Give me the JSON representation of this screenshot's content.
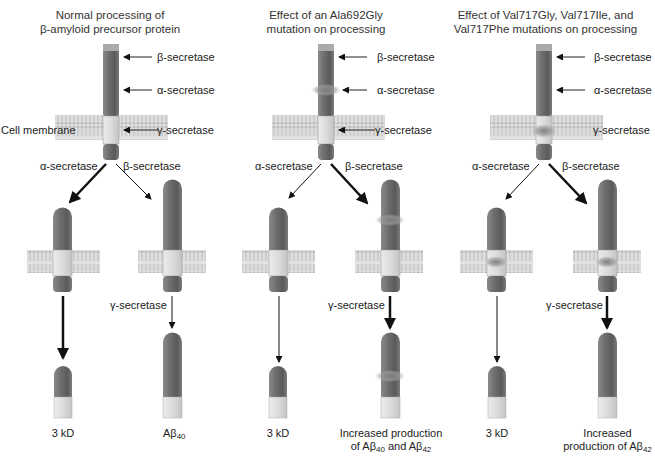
{
  "panels": [
    {
      "title_line1": "Normal processing of",
      "title_line2": "β-amyloid precursor protein",
      "cleavage_labels": {
        "beta": "β-secretase",
        "alpha": "α-secretase",
        "gamma": "γ-secretase"
      },
      "membrane_label": "Cell membrane",
      "branch_left": "α-secretase",
      "branch_right": "β-secretase",
      "gamma_step": "γ-secretase",
      "product_left": "3 kD",
      "product_right_main": "Aβ",
      "product_right_sub": "40",
      "mutation_marker": "none"
    },
    {
      "title_line1": "Effect of an Ala692Gly",
      "title_line2": "mutation on processing",
      "cleavage_labels": {
        "beta": "β-secretase",
        "alpha": "α-secretase",
        "gamma": "γ-secretase"
      },
      "branch_left": "α-secretase",
      "branch_right": "β-secretase",
      "gamma_step": "γ-secretase",
      "product_left": "3 kD",
      "product_right_line1": "Increased production",
      "product_right_line2_a": "of Aβ",
      "product_right_line2_sub1": "40",
      "product_right_line2_b": " and Aβ",
      "product_right_line2_sub2": "42",
      "mutation_marker": "alpha-site"
    },
    {
      "title_line1": "Effect of Val717Gly, Val717Ile, and",
      "title_line2": "Val717Phe mutations on processing",
      "cleavage_labels": {
        "beta": "β-secretase",
        "alpha": "α-secretase",
        "gamma": "γ-secretase"
      },
      "branch_left": "α-secretase",
      "branch_right": "β-secretase",
      "gamma_step": "γ-secretase",
      "product_left": "3 kD",
      "product_right_line1": "Increased",
      "product_right_line2_a": "production of Aβ",
      "product_right_line2_sub": "42",
      "mutation_marker": "gamma-site"
    }
  ],
  "colors": {
    "protein_dark": "#6e6e6e",
    "protein_light": "#d9d9d9",
    "membrane": "#cfcfcf",
    "mutation_glow": "#8a8a8a",
    "arrow": "#111111"
  }
}
